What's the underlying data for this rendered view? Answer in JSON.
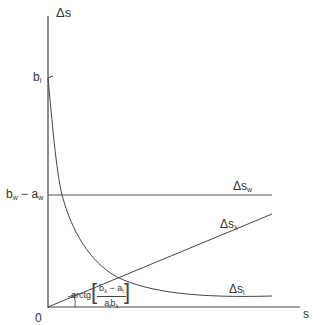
{
  "axes": {
    "y_label": "Δs",
    "x_label": "s",
    "origin_label": "0"
  },
  "y_ticks": {
    "b_l": {
      "base": "b",
      "sub": "l"
    },
    "bw_aw": {
      "b": "b",
      "b_sub": "w",
      "minus": " − ",
      "a": "a",
      "a_sub": "w"
    }
  },
  "curves": {
    "ds_w": {
      "base": "Δs",
      "sub": "w"
    },
    "ds_lambda": {
      "base": "Δs",
      "sub": "λ"
    },
    "ds_l": {
      "base": "Δs",
      "sub": "l"
    }
  },
  "angle_annotation": {
    "prefix": "arctg",
    "numerator": {
      "b": "b",
      "b_sub": "λ",
      "minus": " − ",
      "a": "a",
      "a_sub": "l"
    },
    "denominator": {
      "a": "a",
      "a_sub": "l",
      "b": "b",
      "b_sub": "λ"
    }
  },
  "colors": {
    "line": "#444444",
    "text": "#333333",
    "background": "#ffffff"
  }
}
